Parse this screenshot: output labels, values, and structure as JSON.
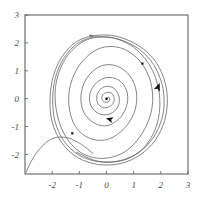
{
  "chart_data": {
    "type": "line",
    "title": "",
    "subtitle": "",
    "xlabel": "",
    "ylabel": "",
    "xlim": [
      -3,
      3
    ],
    "ylim": [
      -2.7,
      3
    ],
    "grid": false,
    "legend": null,
    "axis": {
      "frame": true,
      "frame_color": "#555555",
      "x_ticks": [
        -2,
        -1,
        0,
        1,
        2,
        3
      ],
      "x_tick_labels": [
        "-2",
        "-1",
        "0",
        "1",
        "2",
        "3"
      ],
      "y_ticks": [
        -2,
        -1,
        0,
        1,
        2,
        3
      ],
      "y_tick_labels": [
        "-2",
        "-1",
        "0",
        "1",
        "2",
        "3"
      ],
      "tick_label_color": "#4a4a4a",
      "tick_label_style": "italic-serif"
    },
    "curve_color": "#666666",
    "marker_color": "#111111",
    "series": [
      {
        "name": "unstable-spiral-inner",
        "role": "outward spiral from unstable fixed point at origin",
        "points": [
          [
            0.02,
            0.0
          ],
          [
            0.08,
            0.06
          ],
          [
            0.12,
            0.0
          ],
          [
            0.09,
            -0.09
          ],
          [
            0.0,
            -0.13
          ],
          [
            -0.11,
            -0.1
          ],
          [
            -0.17,
            0.0
          ],
          [
            -0.14,
            0.14
          ],
          [
            0.0,
            0.22
          ],
          [
            0.18,
            0.2
          ],
          [
            0.28,
            0.04
          ],
          [
            0.25,
            -0.16
          ],
          [
            0.08,
            -0.3
          ],
          [
            -0.14,
            -0.32
          ],
          [
            -0.31,
            -0.18
          ],
          [
            -0.36,
            0.06
          ],
          [
            -0.26,
            0.3
          ],
          [
            -0.02,
            0.44
          ],
          [
            0.26,
            0.38
          ],
          [
            0.44,
            0.14
          ],
          [
            0.46,
            -0.18
          ],
          [
            0.28,
            -0.46
          ],
          [
            -0.04,
            -0.58
          ],
          [
            -0.38,
            -0.48
          ],
          [
            -0.6,
            -0.18
          ],
          [
            -0.6,
            0.22
          ],
          [
            -0.36,
            0.58
          ],
          [
            0.04,
            0.76
          ],
          [
            0.46,
            0.66
          ],
          [
            0.74,
            0.3
          ],
          [
            0.76,
            -0.18
          ],
          [
            0.52,
            -0.66
          ],
          [
            0.06,
            -0.96
          ],
          [
            -0.44,
            -0.88
          ],
          [
            -0.84,
            -0.48
          ],
          [
            -0.94,
            0.1
          ],
          [
            -0.74,
            0.72
          ],
          [
            -0.24,
            1.16
          ],
          [
            0.36,
            1.18
          ],
          [
            0.86,
            0.82
          ],
          [
            1.1,
            0.24
          ],
          [
            1.04,
            -0.44
          ],
          [
            0.66,
            -1.06
          ],
          [
            0.04,
            -1.46
          ],
          [
            -0.62,
            -1.42
          ],
          [
            -1.14,
            -1.0
          ],
          [
            -1.38,
            -0.28
          ],
          [
            -1.32,
            0.52
          ],
          [
            -0.94,
            1.28
          ],
          [
            -0.26,
            1.8
          ],
          [
            0.52,
            1.82
          ],
          [
            1.2,
            1.38
          ],
          [
            1.62,
            0.62
          ],
          [
            1.68,
            -0.3
          ],
          [
            1.34,
            -1.2
          ],
          [
            0.68,
            -1.9
          ],
          [
            -0.16,
            -2.14
          ],
          [
            -0.96,
            -1.92
          ],
          [
            -1.56,
            -1.26
          ],
          [
            -1.86,
            -0.34
          ],
          [
            -1.84,
            0.64
          ],
          [
            -1.44,
            1.54
          ],
          [
            -0.7,
            2.12
          ],
          [
            0.22,
            2.18
          ],
          [
            1.08,
            1.78
          ],
          [
            1.7,
            1.0
          ],
          [
            1.96,
            0.02
          ],
          [
            1.84,
            -0.98
          ],
          [
            1.34,
            -1.8
          ],
          [
            0.58,
            -2.22
          ],
          [
            -0.32,
            -2.24
          ],
          [
            -1.1,
            -1.92
          ]
        ]
      },
      {
        "name": "limit-cycle",
        "role": "attracting closed orbit",
        "points": [
          [
            -0.52,
            2.22
          ],
          [
            0.26,
            2.18
          ],
          [
            1.04,
            1.88
          ],
          [
            1.62,
            1.38
          ],
          [
            1.98,
            0.72
          ],
          [
            2.12,
            0.0
          ],
          [
            2.04,
            -0.72
          ],
          [
            1.72,
            -1.4
          ],
          [
            1.2,
            -1.92
          ],
          [
            0.5,
            -2.22
          ],
          [
            -0.28,
            -2.26
          ],
          [
            -1.02,
            -2.02
          ],
          [
            -1.58,
            -1.5
          ],
          [
            -1.9,
            -0.8
          ],
          [
            -1.98,
            -0.02
          ],
          [
            -1.88,
            0.76
          ],
          [
            -1.58,
            1.44
          ],
          [
            -1.1,
            1.96
          ],
          [
            -0.52,
            2.22
          ]
        ]
      },
      {
        "name": "outer-trajectory",
        "role": "trajectory spiraling inward onto the limit cycle",
        "points": [
          [
            -0.6,
            2.26
          ],
          [
            0.26,
            2.26
          ],
          [
            1.08,
            1.96
          ],
          [
            1.72,
            1.44
          ],
          [
            2.1,
            0.76
          ],
          [
            2.24,
            0.0
          ],
          [
            2.14,
            -0.78
          ],
          [
            1.8,
            -1.48
          ],
          [
            1.26,
            -2.0
          ],
          [
            0.54,
            -2.32
          ],
          [
            -0.3,
            -2.36
          ],
          [
            -1.08,
            -2.1
          ],
          [
            -1.66,
            -1.56
          ],
          [
            -2.0,
            -0.84
          ],
          [
            -2.08,
            -0.02
          ],
          [
            -1.96,
            0.8
          ],
          [
            -1.64,
            1.5
          ],
          [
            -1.14,
            2.02
          ],
          [
            -0.56,
            2.26
          ]
        ]
      },
      {
        "name": "separatrix-from-lower-left",
        "role": "incoming trajectory from bottom-left corner",
        "points": [
          [
            -2.96,
            -2.64
          ],
          [
            -2.8,
            -2.3
          ],
          [
            -2.62,
            -2.0
          ],
          [
            -2.44,
            -1.78
          ],
          [
            -2.24,
            -1.58
          ],
          [
            -2.02,
            -1.44
          ],
          [
            -1.8,
            -1.38
          ],
          [
            -1.58,
            -1.38
          ],
          [
            -1.36,
            -1.42
          ],
          [
            -1.14,
            -1.52
          ],
          [
            -0.92,
            -1.64
          ],
          [
            -0.7,
            -1.8
          ],
          [
            -0.5,
            -1.96
          ]
        ]
      }
    ],
    "markers": [
      {
        "name": "fixed-point",
        "x": 0.0,
        "y": 0.0,
        "shape": "dot",
        "size": 2.6
      },
      {
        "name": "initial-condition-upper-right",
        "x": 1.32,
        "y": 1.26,
        "shape": "square",
        "size": 2.2
      },
      {
        "name": "initial-condition-lower-left",
        "x": -1.26,
        "y": -1.24,
        "shape": "square",
        "size": 2.2
      }
    ],
    "arrows": [
      {
        "name": "inner-spiral-arrow",
        "x": -0.02,
        "y": -0.7,
        "angle_deg": 196,
        "size": 7
      },
      {
        "name": "limit-cycle-arrow",
        "x": 1.96,
        "y": 0.56,
        "angle_deg": 292,
        "size": 8
      }
    ]
  }
}
